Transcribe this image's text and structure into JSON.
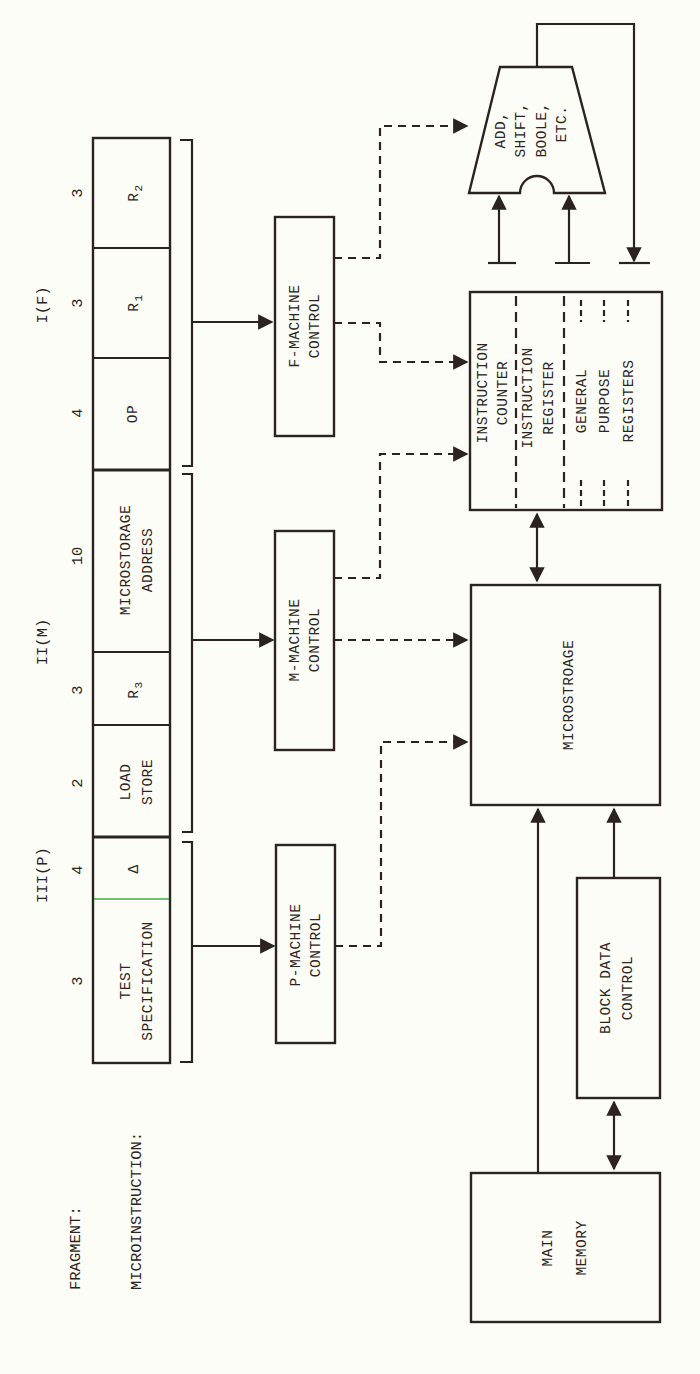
{
  "labels": {
    "fragment": "FRAGMENT:",
    "microinstruction": "MICROINSTRUCTION:"
  },
  "fragments": [
    {
      "id": "I",
      "label": "I(F)"
    },
    {
      "id": "II",
      "label": "II(M)"
    },
    {
      "id": "III",
      "label": "III(P)"
    }
  ],
  "fields": [
    {
      "name": "R2",
      "base": "R",
      "sub": "2",
      "bits": "3",
      "fragment": "I(F)"
    },
    {
      "name": "R1",
      "base": "R",
      "sub": "1",
      "bits": "3",
      "fragment": "I(F)"
    },
    {
      "name": "OP",
      "line1": "OP",
      "bits": "4",
      "fragment": "I(F)"
    },
    {
      "name": "MICROSTORAGE ADDRESS",
      "line1": "MICROSTORAGE",
      "line2": "ADDRESS",
      "bits": "10",
      "fragment": "II(M)"
    },
    {
      "name": "R3",
      "base": "R",
      "sub": "3",
      "bits": "3",
      "fragment": "II(M)"
    },
    {
      "name": "LOAD STORE",
      "line1": "LOAD",
      "line2": "STORE",
      "bits": "2",
      "fragment": "II(M)"
    },
    {
      "name": "DELTA",
      "line1": "Δ",
      "bits": "4",
      "fragment": "III(P)"
    },
    {
      "name": "TEST SPECIFICATION",
      "line1": "TEST",
      "line2": "SPECIFICATION",
      "bits": "3",
      "fragment": "III(P)"
    }
  ],
  "controls": {
    "f": {
      "line1": "F-MACHINE",
      "line2": "CONTROL"
    },
    "m": {
      "line1": "M-MACHINE",
      "line2": "CONTROL"
    },
    "p": {
      "line1": "P-MACHINE",
      "line2": "CONTROL"
    }
  },
  "alu": {
    "lines": [
      "ADD,",
      "SHIFT,",
      "BOOLE,",
      "ETC."
    ]
  },
  "registers": {
    "instruction_counter": {
      "line1": "INSTRUCTION",
      "line2": "COUNTER"
    },
    "instruction_register": {
      "line1": "INSTRUCTION",
      "line2": "REGISTER"
    },
    "general_purpose": {
      "line1": "GENERAL",
      "line2": "PURPOSE",
      "line3": "REGISTERS"
    }
  },
  "blocks": {
    "microstorage": "MICROSTROAGE",
    "block_data_control": {
      "line1": "BLOCK DATA",
      "line2": "CONTROL"
    },
    "main_memory": {
      "line1": "MAIN",
      "line2": "MEMORY"
    }
  },
  "colors": {
    "ink": "#2b2320",
    "paper": "#fdfdf7",
    "highlight_line": "#3cb043"
  }
}
